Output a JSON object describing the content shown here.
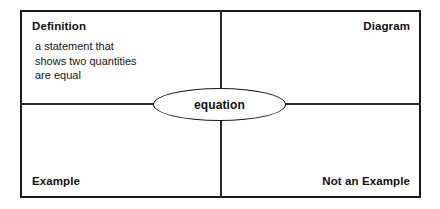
{
  "diagram": {
    "type": "frayer-model",
    "center_term": "equation",
    "quadrants": {
      "top_left": {
        "label": "Definition",
        "body": "a statement that\nshows two quantities\nare equal"
      },
      "top_right": {
        "label": "Diagram",
        "body": ""
      },
      "bottom_left": {
        "label": "Example",
        "body": ""
      },
      "bottom_right": {
        "label": "Not an Example",
        "body": ""
      }
    },
    "colors": {
      "border": "#1a1a1a",
      "divider": "#2b2b2b",
      "text": "#111111",
      "background": "#ffffff"
    }
  }
}
